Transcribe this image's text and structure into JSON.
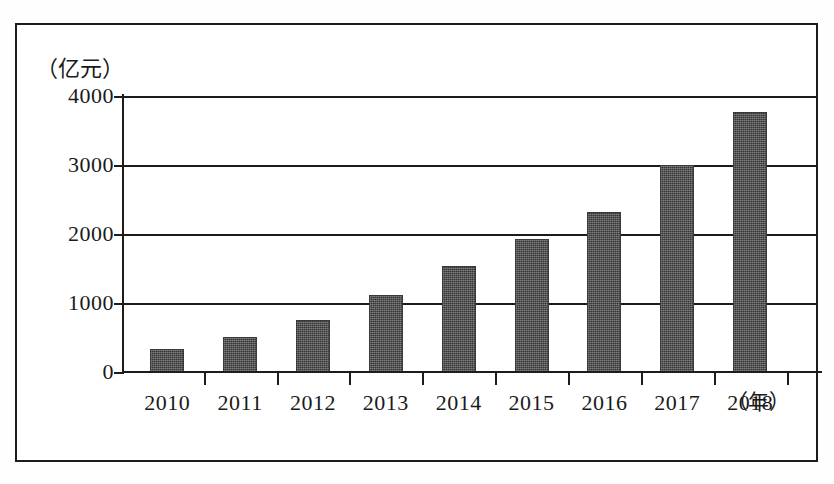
{
  "figure": {
    "frame_color": "#1c1c1c",
    "background": "#ffffff"
  },
  "chart_data": {
    "type": "bar",
    "title": "",
    "xlabel": "年",
    "ylabel": "亿元",
    "ylabel_display": "（亿元）",
    "xlabel_display": "（年）",
    "categories": [
      "2010",
      "2011",
      "2012",
      "2013",
      "2014",
      "2015",
      "2016",
      "2017",
      "2018"
    ],
    "values": [
      330,
      510,
      760,
      1110,
      1530,
      1930,
      2320,
      3000,
      3770
    ],
    "ylim": [
      0,
      4000
    ],
    "yticks": [
      0,
      1000,
      2000,
      3000,
      4000
    ],
    "ytick_labels": [
      "0",
      "1000",
      "2000",
      "3000",
      "4000"
    ],
    "grid": true,
    "grid_axis": "y",
    "legend": false,
    "bar_color": "#4d4d4d",
    "series": [
      {
        "name": "",
        "values": [
          330,
          510,
          760,
          1110,
          1530,
          1930,
          2320,
          3000,
          3770
        ]
      }
    ]
  }
}
